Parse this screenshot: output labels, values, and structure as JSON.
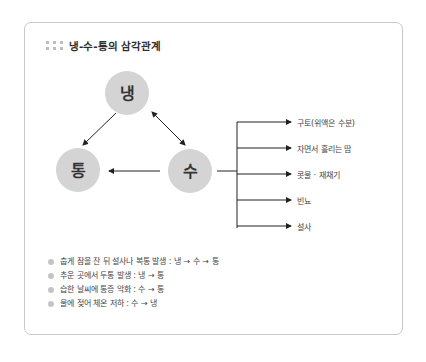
{
  "title": "냉-수-통의 삼각관계",
  "title_icon": "grid-dots-icon",
  "colors": {
    "node_fill": "#d4d4d4",
    "line": "#222222",
    "border": "#c8c8c8",
    "bullet": "#c4c4c4",
    "title_dots": "#bdbdbd"
  },
  "nodes": [
    {
      "id": "naeng",
      "label": "냉"
    },
    {
      "id": "tong",
      "label": "통"
    },
    {
      "id": "su",
      "label": "수"
    }
  ],
  "relations": [
    {
      "from": "냉",
      "to": "통",
      "type": "arrow"
    },
    {
      "from": "냉",
      "to": "수",
      "type": "bidirectional"
    },
    {
      "from": "수",
      "to": "통",
      "type": "arrow"
    }
  ],
  "branches": [
    {
      "label": "구토(위액은 수분)"
    },
    {
      "label": "자면서 흘리는 땀"
    },
    {
      "label": "콧물 · 재채기"
    },
    {
      "label": "빈뇨"
    },
    {
      "label": "설사"
    }
  ],
  "bullets": [
    {
      "text": "춥게 잠을 잔 뒤 설사나 복통 발생 : 냉 → 수 → 통"
    },
    {
      "text": "추운 곳에서 두통 발생 : 냉 → 통"
    },
    {
      "text": "습한 날씨에 통증 악화 : 수 → 통"
    },
    {
      "text": "물에 젖어 체온 저하 : 수 → 냉"
    }
  ]
}
